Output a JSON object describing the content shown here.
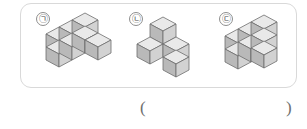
{
  "page": {
    "background_color": "#ffffff",
    "width": 307,
    "height": 129
  },
  "figure_box": {
    "border_color": "#d9d9d9",
    "fill_color": "#ffffff",
    "corner_radius": 11
  },
  "palette": {
    "cube_top": "#e9e9e9",
    "cube_left": "#b9b9b9",
    "cube_right": "#d2d2d2",
    "cube_stroke": "#6d6d6d",
    "label_text": "#4a4a4a",
    "label_border": "#8e8e8e",
    "paren_color": "#6e6e6e"
  },
  "figures": [
    {
      "id": "figure-a",
      "label": "㉠",
      "label_name": "circled-giyeok",
      "description": "L-shaped flat arrangement of unit cubes, one layer tall",
      "cube_count": 7,
      "cubes": [
        {
          "x": 0,
          "y": 0,
          "z": 0
        },
        {
          "x": 1,
          "y": 0,
          "z": 0
        },
        {
          "x": 2,
          "y": 0,
          "z": 0
        },
        {
          "x": 0,
          "y": 1,
          "z": 0
        },
        {
          "x": 1,
          "y": 1,
          "z": 0
        },
        {
          "x": 2,
          "y": 1,
          "z": 0
        },
        {
          "x": 2,
          "y": 2,
          "z": 0
        }
      ]
    },
    {
      "id": "figure-b",
      "label": "㉡",
      "label_name": "circled-nieun",
      "description": "Central raised cube with three arms radiating outward",
      "cube_count": 4,
      "cubes": [
        {
          "x": 1,
          "y": 1,
          "z": 1
        },
        {
          "x": 0,
          "y": 1,
          "z": 0
        },
        {
          "x": 1,
          "y": 0,
          "z": 0
        },
        {
          "x": 2,
          "y": 2,
          "z": 0
        }
      ]
    },
    {
      "id": "figure-c",
      "label": "㉢",
      "label_name": "circled-digeut",
      "description": "Two-layer wall of cubes with one cube set forward at lower right",
      "cube_count": 7,
      "cubes": [
        {
          "x": 0,
          "y": 0,
          "z": 0
        },
        {
          "x": 1,
          "y": 0,
          "z": 0
        },
        {
          "x": 2,
          "y": 0,
          "z": 0
        },
        {
          "x": 0,
          "y": 0,
          "z": 1
        },
        {
          "x": 1,
          "y": 0,
          "z": 1
        },
        {
          "x": 2,
          "y": 0,
          "z": 1
        },
        {
          "x": 2,
          "y": 1,
          "z": 0
        }
      ]
    }
  ],
  "answer": {
    "open_paren": "(",
    "close_paren": ")",
    "value": "",
    "placeholder": ""
  }
}
